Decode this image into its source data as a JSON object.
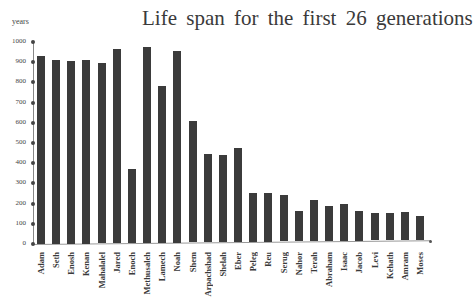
{
  "chart_data": {
    "type": "bar",
    "title": "Life span for the first 26 generations",
    "xlabel": "",
    "ylabel": "years",
    "ylim": [
      0,
      1000
    ],
    "yticks": [
      0,
      100,
      200,
      300,
      400,
      500,
      600,
      700,
      800,
      900,
      1000
    ],
    "grid": false,
    "legend": null,
    "categories": [
      "Adam",
      "Seth",
      "Enosh",
      "Kenan",
      "Mahalalel",
      "Jared",
      "Enoch",
      "Methusaleh",
      "Lamech",
      "Noah",
      "Shem",
      "Arpachshad",
      "Shelah",
      "Eber",
      "Peleg",
      "Reu",
      "Serug",
      "Nahor",
      "Terah",
      "Abraham",
      "Isaac",
      "Jacob",
      "Levi",
      "Kehath",
      "Amram",
      "Moses"
    ],
    "values": [
      930,
      912,
      905,
      910,
      895,
      962,
      365,
      969,
      777,
      950,
      600,
      438,
      433,
      464,
      239,
      239,
      230,
      148,
      205,
      175,
      180,
      147,
      137,
      133,
      137,
      120
    ]
  },
  "title": "Life span for the first 26 generations",
  "ylabel": "years",
  "bar_color": "#3b3b3b"
}
